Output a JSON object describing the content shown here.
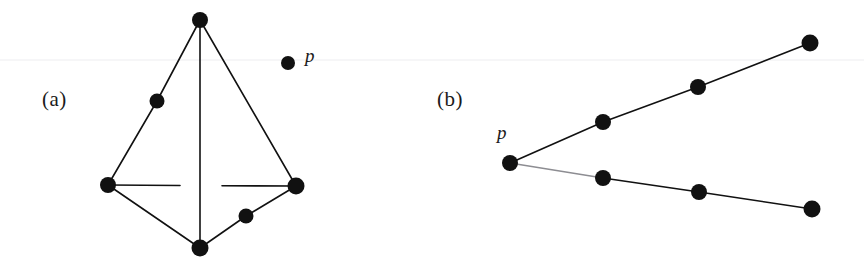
{
  "figure": {
    "background_color": "#ffffff",
    "ink_color": "#111111",
    "scanline_color": "#ededf0",
    "width": 864,
    "height": 271,
    "node_radius": 7.5,
    "edge_width": 1.6,
    "scanline_y": 60,
    "panels": [
      {
        "id": "a",
        "label": "(a)",
        "label_x": 42,
        "label_y": 87,
        "point_label": "p",
        "point_label_x": 305,
        "point_label_y": 45,
        "nodes": [
          {
            "name": "apex",
            "x": 200,
            "y": 20,
            "r": 8.0
          },
          {
            "name": "upper-left",
            "x": 157,
            "y": 101,
            "r": 7.5
          },
          {
            "name": "left",
            "x": 108,
            "y": 185,
            "r": 8.0
          },
          {
            "name": "right",
            "x": 296,
            "y": 186,
            "r": 8.5
          },
          {
            "name": "lower-right",
            "x": 246,
            "y": 216,
            "r": 7.5
          },
          {
            "name": "bottom",
            "x": 200,
            "y": 248,
            "r": 8.5
          },
          {
            "name": "isolated-p",
            "x": 288,
            "y": 63,
            "r": 7.0
          }
        ],
        "edges": [
          {
            "name": "apex-to-upper-left",
            "x1": 200,
            "y1": 20,
            "x2": 157,
            "y2": 101,
            "hidden": false
          },
          {
            "name": "upper-left-to-left",
            "x1": 157,
            "y1": 101,
            "x2": 108,
            "y2": 185,
            "hidden": false
          },
          {
            "name": "apex-to-right",
            "x1": 200,
            "y1": 20,
            "x2": 296,
            "y2": 186,
            "hidden": false
          },
          {
            "name": "apex-to-bottom",
            "x1": 200,
            "y1": 20,
            "x2": 200,
            "y2": 248,
            "hidden": false
          },
          {
            "name": "left-to-bottom",
            "x1": 108,
            "y1": 185,
            "x2": 200,
            "y2": 248,
            "hidden": false
          },
          {
            "name": "bottom-to-lower-right",
            "x1": 200,
            "y1": 248,
            "x2": 246,
            "y2": 216,
            "hidden": false
          },
          {
            "name": "lower-right-to-right",
            "x1": 246,
            "y1": 216,
            "x2": 296,
            "y2": 186,
            "hidden": false
          },
          {
            "name": "left-to-right-back-1",
            "x1": 108,
            "y1": 185,
            "x2": 180,
            "y2": 185.5,
            "hidden": false
          },
          {
            "name": "left-to-right-back-2",
            "x1": 222,
            "y1": 185.8,
            "x2": 296,
            "y2": 186,
            "hidden": false
          }
        ]
      },
      {
        "id": "b",
        "label": "(b)",
        "label_x": 437,
        "label_y": 87,
        "point_label": "p",
        "point_label_x": 497,
        "point_label_y": 122,
        "nodes": [
          {
            "name": "p-vertex",
            "x": 510,
            "y": 163,
            "r": 8.0
          },
          {
            "name": "upper-node-1",
            "x": 603,
            "y": 122,
            "r": 8.0
          },
          {
            "name": "upper-node-2",
            "x": 698,
            "y": 87,
            "r": 8.0
          },
          {
            "name": "upper-endpoint",
            "x": 810,
            "y": 43,
            "r": 8.5
          },
          {
            "name": "lower-node-1",
            "x": 603,
            "y": 178,
            "r": 8.0
          },
          {
            "name": "lower-node-2",
            "x": 699,
            "y": 192,
            "r": 8.0
          },
          {
            "name": "lower-endpoint",
            "x": 812,
            "y": 209,
            "r": 8.5
          }
        ],
        "edges": [
          {
            "name": "p-to-upper-node-1",
            "x1": 510,
            "y1": 163,
            "x2": 603,
            "y2": 122,
            "hidden": false
          },
          {
            "name": "upper-node-1-to-upper-node-2",
            "x1": 603,
            "y1": 122,
            "x2": 698,
            "y2": 87,
            "hidden": false
          },
          {
            "name": "upper-node-2-to-endpoint",
            "x1": 698,
            "y1": 87,
            "x2": 810,
            "y2": 43,
            "hidden": false
          },
          {
            "name": "p-to-lower-node-1",
            "x1": 510,
            "y1": 163,
            "x2": 603,
            "y2": 178,
            "hidden": true
          },
          {
            "name": "lower-node-1-to-lower-node-2",
            "x1": 603,
            "y1": 178,
            "x2": 699,
            "y2": 192,
            "hidden": false
          },
          {
            "name": "lower-node-2-to-endpoint",
            "x1": 699,
            "y1": 192,
            "x2": 812,
            "y2": 209,
            "hidden": false
          }
        ]
      }
    ]
  }
}
